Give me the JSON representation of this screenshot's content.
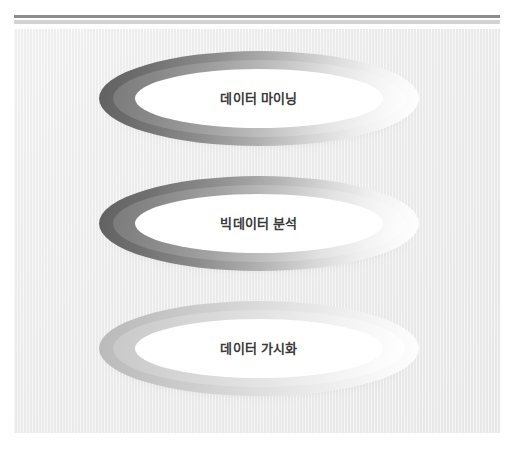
{
  "slide": {
    "background_color": "#efefef",
    "rule_dark_color": "#8d8d8d",
    "rule_light_color": "#d3d3d3",
    "shapes": [
      {
        "id": "ellipse-data-mining",
        "label": "데이터 마이닝",
        "tone": "dark",
        "ring_color_dark": "#5f5f5f",
        "ring_color_light": "#ffffff",
        "center_color": "#ffffff",
        "text_color": "#3a3a3a"
      },
      {
        "id": "ellipse-big-data-analysis",
        "label": "빅데이터 분석",
        "tone": "dark",
        "ring_color_dark": "#6a6a6a",
        "ring_color_light": "#ffffff",
        "center_color": "#ffffff",
        "text_color": "#3a3a3a"
      },
      {
        "id": "ellipse-data-visualization",
        "label": "데이터 가시화",
        "tone": "light",
        "ring_color_dark": "#b9b9b9",
        "ring_color_light": "#ffffff",
        "center_color": "#ffffff",
        "text_color": "#3a3a3a"
      }
    ]
  }
}
